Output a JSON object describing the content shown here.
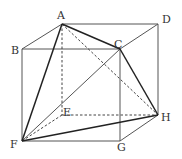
{
  "diagram": {
    "type": "geometry-cube",
    "points": {
      "A": {
        "label": "A",
        "x": 62,
        "y": 24,
        "lx": 57,
        "ly": 19
      },
      "D": {
        "label": "D",
        "x": 158,
        "y": 24,
        "lx": 162,
        "ly": 23
      },
      "B": {
        "label": "B",
        "x": 22,
        "y": 49,
        "lx": 11,
        "ly": 54
      },
      "C": {
        "label": "C",
        "x": 120,
        "y": 49,
        "lx": 114,
        "ly": 48
      },
      "E": {
        "label": "E",
        "x": 62,
        "y": 115,
        "lx": 63,
        "ly": 116
      },
      "H": {
        "label": "H",
        "x": 158,
        "y": 115,
        "lx": 161,
        "ly": 121
      },
      "F": {
        "label": "F",
        "x": 22,
        "y": 141,
        "lx": 10,
        "ly": 148
      },
      "G": {
        "label": "G",
        "x": 120,
        "y": 141,
        "lx": 117,
        "ly": 151
      }
    },
    "edges_solid": [
      "A-D",
      "B-C",
      "D-H",
      "B-F",
      "F-G",
      "C-G",
      "G-H",
      "A-B",
      "C-D"
    ],
    "edges_bold": [
      "A-C",
      "A-F",
      "C-H",
      "F-H",
      "F-C"
    ],
    "edges_dashed": [
      "A-E",
      "E-H",
      "E-F",
      "A-H"
    ]
  }
}
